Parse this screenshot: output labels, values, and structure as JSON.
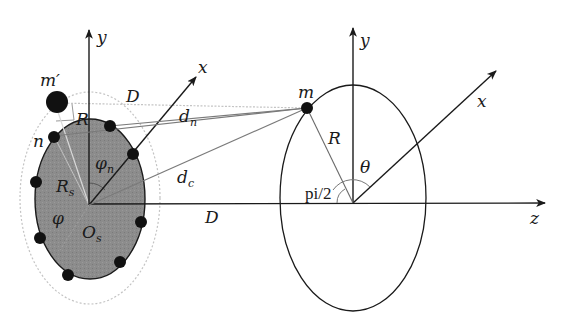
{
  "figure": {
    "type": "geometric diagram",
    "left_body": {
      "origin_label": "O",
      "origin_sub": "s",
      "axis_y_label": "y",
      "axis_x_label": "x",
      "radius_label": "R",
      "radius_sub": "s",
      "angle_phi_label": "φ",
      "angle_phin_label": "φ",
      "angle_phin_sub": "n",
      "point_n_label": "n",
      "point_mprime_label": "m′",
      "offset_R_label": "R",
      "distance_D_top_label": "D",
      "fill_color": "#8a8a8a",
      "outline_dotted_color": "#b8b8b8",
      "peripheral_points": 9
    },
    "right_body": {
      "axis_y_label": "y",
      "axis_x_label": "x",
      "axis_z_label": "z",
      "point_m_label": "m",
      "radius_label": "R",
      "angle_theta_label": "θ",
      "right_angle_label": "pi/2"
    },
    "connections": {
      "dn_label": "d",
      "dn_sub": "n",
      "dc_label": "d",
      "dc_sub": "c",
      "distance_D_bottom_label": "D"
    },
    "colors": {
      "line": "#1a1a1a",
      "gray_line": "#7a7a7a",
      "light_dotted": "#c4c4c4"
    }
  }
}
